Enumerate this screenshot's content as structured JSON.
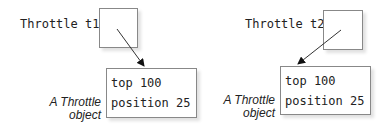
{
  "references": [
    {
      "label": "Throttle t1"
    },
    {
      "label": "Throttle t2"
    }
  ],
  "objects": [
    {
      "caption_line1": "A Throttle",
      "caption_line2": "object",
      "fields": [
        "top 100",
        "position 25"
      ]
    },
    {
      "caption_line1": "A Throttle",
      "caption_line2": "object",
      "fields": [
        "top 100",
        "position 25"
      ]
    }
  ]
}
